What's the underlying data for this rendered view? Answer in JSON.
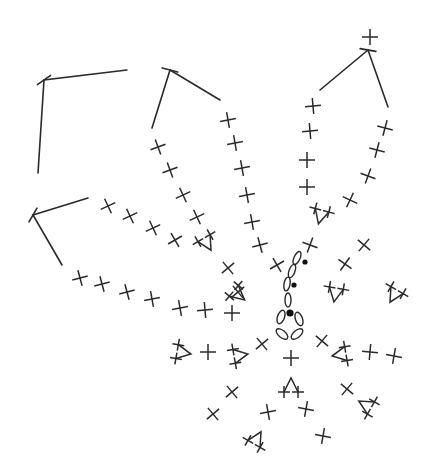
{
  "diagram": {
    "type": "crochet-chart",
    "colors": {
      "stroke": "#2a2a2a",
      "background": "#ffffff"
    },
    "center_ring": [
      {
        "x": 281,
        "y": 317,
        "rx": 3.5,
        "ry": 7,
        "rot": 20
      },
      {
        "x": 299,
        "y": 319,
        "rx": 3.5,
        "ry": 7,
        "rot": -20
      },
      {
        "x": 282,
        "y": 334,
        "rx": 3.5,
        "ry": 7,
        "rot": -50
      },
      {
        "x": 297,
        "y": 334,
        "rx": 3.5,
        "ry": 7,
        "rot": 50
      }
    ],
    "chain_stitches": [
      {
        "x": 288,
        "y": 300,
        "rx": 3,
        "ry": 7,
        "rot": 0
      },
      {
        "x": 287,
        "y": 284,
        "rx": 3,
        "ry": 7,
        "rot": 10
      },
      {
        "x": 292,
        "y": 271,
        "rx": 3,
        "ry": 7,
        "rot": 20
      },
      {
        "x": 297,
        "y": 258,
        "rx": 3,
        "ry": 7,
        "rot": 25
      }
    ],
    "slip_stitches": [
      {
        "x": 290,
        "y": 313,
        "r": 3.6
      },
      {
        "x": 294,
        "y": 285,
        "r": 2.6
      },
      {
        "x": 305,
        "y": 262,
        "r": 2.6
      }
    ],
    "single_crochet": [
      {
        "x": 370,
        "y": 37,
        "a": 0
      },
      {
        "x": 313,
        "y": 106,
        "a": -5
      },
      {
        "x": 310,
        "y": 131,
        "a": -5
      },
      {
        "x": 307,
        "y": 160,
        "a": 0
      },
      {
        "x": 307,
        "y": 187,
        "a": 0
      },
      {
        "x": 385,
        "y": 128,
        "a": 15
      },
      {
        "x": 377,
        "y": 150,
        "a": 15
      },
      {
        "x": 368,
        "y": 176,
        "a": 20
      },
      {
        "x": 350,
        "y": 200,
        "a": 25
      },
      {
        "x": 310,
        "y": 245,
        "a": 20
      },
      {
        "x": 364,
        "y": 245,
        "a": 40
      },
      {
        "x": 345,
        "y": 264,
        "a": 35
      },
      {
        "x": 228,
        "y": 120,
        "a": -10
      },
      {
        "x": 235,
        "y": 143,
        "a": -10
      },
      {
        "x": 242,
        "y": 168,
        "a": -10
      },
      {
        "x": 247,
        "y": 195,
        "a": -10
      },
      {
        "x": 252,
        "y": 222,
        "a": -10
      },
      {
        "x": 260,
        "y": 245,
        "a": -15
      },
      {
        "x": 277,
        "y": 265,
        "a": -30
      },
      {
        "x": 158,
        "y": 147,
        "a": -20
      },
      {
        "x": 170,
        "y": 170,
        "a": -20
      },
      {
        "x": 183,
        "y": 195,
        "a": -25
      },
      {
        "x": 197,
        "y": 217,
        "a": -25
      },
      {
        "x": 228,
        "y": 268,
        "a": -40
      },
      {
        "x": 238,
        "y": 292,
        "a": -40
      },
      {
        "x": 108,
        "y": 206,
        "a": -25
      },
      {
        "x": 130,
        "y": 216,
        "a": -25
      },
      {
        "x": 153,
        "y": 228,
        "a": -25
      },
      {
        "x": 175,
        "y": 240,
        "a": -30
      },
      {
        "x": 80,
        "y": 278,
        "a": -15
      },
      {
        "x": 102,
        "y": 284,
        "a": -15
      },
      {
        "x": 127,
        "y": 292,
        "a": -15
      },
      {
        "x": 152,
        "y": 299,
        "a": -10
      },
      {
        "x": 180,
        "y": 308,
        "a": -10
      },
      {
        "x": 205,
        "y": 310,
        "a": -5
      },
      {
        "x": 232,
        "y": 313,
        "a": 0
      },
      {
        "x": 262,
        "y": 344,
        "a": -40
      },
      {
        "x": 322,
        "y": 341,
        "a": 40
      },
      {
        "x": 370,
        "y": 352,
        "a": 5
      },
      {
        "x": 394,
        "y": 356,
        "a": 10
      },
      {
        "x": 208,
        "y": 352,
        "a": 0
      },
      {
        "x": 291,
        "y": 358,
        "a": 0
      },
      {
        "x": 232,
        "y": 392,
        "a": -40
      },
      {
        "x": 213,
        "y": 414,
        "a": -40
      },
      {
        "x": 268,
        "y": 412,
        "a": -10
      },
      {
        "x": 306,
        "y": 409,
        "a": 10
      },
      {
        "x": 347,
        "y": 389,
        "a": 40
      },
      {
        "x": 323,
        "y": 436,
        "a": 10
      }
    ],
    "increases": [
      {
        "x": 320,
        "y": 218,
        "a": 15
      },
      {
        "x": 208,
        "y": 245,
        "a": -30
      },
      {
        "x": 240,
        "y": 296,
        "a": -50
      },
      {
        "x": 335,
        "y": 296,
        "a": 10
      },
      {
        "x": 393,
        "y": 297,
        "a": 30
      },
      {
        "x": 185,
        "y": 353,
        "a": -80
      },
      {
        "x": 242,
        "y": 355,
        "a": -100
      },
      {
        "x": 338,
        "y": 355,
        "a": 80
      },
      {
        "x": 291,
        "y": 384,
        "a": 180
      },
      {
        "x": 364,
        "y": 404,
        "a": 120
      },
      {
        "x": 258,
        "y": 437,
        "a": -150
      }
    ],
    "chain_loops": [
      {
        "pts": [
          [
            38,
            173
          ],
          [
            44,
            80
          ],
          [
            127,
            70
          ]
        ],
        "tick": [
          44,
          80,
          -35
        ]
      },
      {
        "pts": [
          [
            152,
            128
          ],
          [
            170,
            70
          ],
          [
            220,
            100
          ]
        ],
        "tick": [
          170,
          70,
          15
        ]
      },
      {
        "pts": [
          [
            320,
            90
          ],
          [
            368,
            50
          ],
          [
            388,
            107
          ]
        ],
        "tick": [
          368,
          50,
          10
        ]
      },
      {
        "pts": [
          [
            88,
            198
          ],
          [
            33,
            215
          ],
          [
            62,
            265
          ]
        ],
        "tick": [
          33,
          215,
          -60
        ]
      }
    ]
  }
}
